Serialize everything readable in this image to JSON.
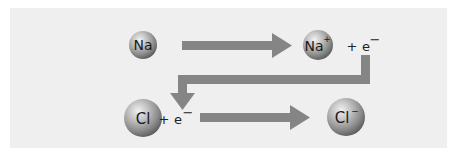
{
  "diagram": {
    "colors": {
      "background": "#ffffff",
      "panel": "#efefef",
      "arrow": "#858585",
      "sphere_light": "#e2e2e2",
      "sphere_dark": "#6a6a6a",
      "text": "#1a1a1a"
    },
    "row1": {
      "reactant": {
        "symbol": "Na",
        "charge": ""
      },
      "product": {
        "symbol": "Na",
        "charge": "+"
      },
      "released": {
        "plus": "+",
        "symbol": "e",
        "charge": "−"
      }
    },
    "row2": {
      "reactant": {
        "symbol": "Cl",
        "charge": ""
      },
      "added": {
        "plus": "+",
        "symbol": "e",
        "charge": "−"
      },
      "product": {
        "symbol": "Cl",
        "charge": "−"
      }
    },
    "arrows": [
      {
        "name": "na-to-na-plus",
        "direction": "right"
      },
      {
        "name": "electron-transfer",
        "direction": "down-left-down"
      },
      {
        "name": "cl-to-cl-minus",
        "direction": "right"
      }
    ]
  }
}
